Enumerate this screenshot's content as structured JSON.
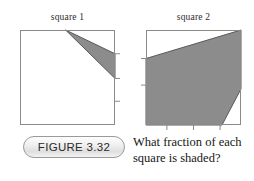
{
  "figure": {
    "badge_label": "FIGURE 3.32",
    "question": "What fraction of each square is shaded?",
    "label_square_1": "square 1",
    "label_square_2": "square 2"
  },
  "style": {
    "shade_color": "#8c8c8c",
    "shade_stroke": "#595959",
    "square_stroke": "#8a8a8a",
    "tick_color": "#8a8a8a",
    "background": "#ffffff"
  },
  "chart_data": {
    "type": "diagram",
    "title": "FIGURE 3.32",
    "subtitle": "What fraction of each square is shaded?",
    "units": "fraction of unit square (coordinates 0-1, origin top-left)",
    "figures": [
      {
        "name": "square 1",
        "outline": [
          [
            0,
            0
          ],
          [
            1,
            0
          ],
          [
            1,
            1
          ],
          [
            0,
            1
          ]
        ],
        "shaded_regions": [
          {
            "name": "triangle-from-top-edge",
            "vertices": [
              [
                0.48,
                0.0
              ],
              [
                1.0,
                0.25
              ],
              [
                1.0,
                0.51
              ]
            ],
            "fill": "#8c8c8c"
          }
        ],
        "ticks": {
          "right_edge": [
            0.25,
            0.51,
            0.75
          ],
          "bottom_edge": [],
          "left_edge": [],
          "top_edge": []
        }
      },
      {
        "name": "square 2",
        "outline": [
          [
            0,
            0
          ],
          [
            1,
            0
          ],
          [
            1,
            1
          ],
          [
            0,
            1
          ]
        ],
        "shaded_regions": [
          {
            "name": "pentagon-major-shaded",
            "vertices": [
              [
                0.0,
                0.3
              ],
              [
                1.0,
                0.0
              ],
              [
                1.0,
                0.62
              ],
              [
                0.8,
                1.0
              ],
              [
                0.0,
                1.0
              ]
            ],
            "fill": "#8c8c8c"
          }
        ],
        "ticks": {
          "right_edge": [],
          "bottom_edge": [
            0.22,
            0.5,
            0.78
          ],
          "left_edge": [
            0.3,
            0.58
          ],
          "top_edge": []
        }
      }
    ]
  }
}
